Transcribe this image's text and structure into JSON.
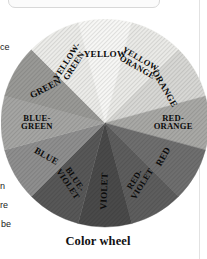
{
  "figure": {
    "caption": "Color wheel",
    "center": {
      "x": 104,
      "y": 104
    },
    "radius": 104
  },
  "margin_text_fragments": [
    {
      "id": "ce",
      "text": "ce"
    },
    {
      "id": "n",
      "text": "n"
    },
    {
      "id": "re",
      "text": "re"
    },
    {
      "id": "be",
      "text": "be"
    }
  ],
  "chart_data": {
    "type": "pie",
    "title": "Color wheel",
    "legend_position": "none",
    "grid": false,
    "note": "Twelve equal 30-degree segments of a color wheel, reproduced in grayscale halftone. Segment 1 (YELLOW) is centered at the top (12 o'clock) and segments proceed clockwise.",
    "categories": [
      "YELLOW",
      "YELLOW-ORANGE",
      "ORANGE",
      "RED-ORANGE",
      "RED",
      "RED-VIOLET",
      "VIOLET",
      "BLUE-VIOLET",
      "BLUE",
      "BLUE-GREEN",
      "GREEN",
      "YELLOW-GREEN"
    ],
    "values": [
      30,
      30,
      30,
      30,
      30,
      30,
      30,
      30,
      30,
      30,
      30,
      30
    ],
    "units": "degrees",
    "slice_colors": [
      "#f8f8f6",
      "#ebebe8",
      "#d8d8d5",
      "#a9a9a6",
      "#6f6f6f",
      "#5e5e5e",
      "#4a4a4a",
      "#585858",
      "#8f8f8f",
      "#a6a6a4",
      "#9a9a97",
      "#ededea"
    ],
    "segments": [
      {
        "label": "YELLOW",
        "lines": [
          "YELLOW"
        ],
        "start_deg": -15,
        "end_deg": 15,
        "color": "#f8f8f6",
        "label_rotation_deg": 0,
        "two_line": false
      },
      {
        "label": "YELLOW-ORANGE",
        "lines": [
          "YELLOW-",
          "ORANGE"
        ],
        "start_deg": 15,
        "end_deg": 45,
        "color": "#ebebe8",
        "label_rotation_deg": 30,
        "two_line": true
      },
      {
        "label": "ORANGE",
        "lines": [
          "ORANGE"
        ],
        "start_deg": 45,
        "end_deg": 75,
        "color": "#d8d8d5",
        "label_rotation_deg": 60,
        "two_line": false
      },
      {
        "label": "RED-ORANGE",
        "lines": [
          "RED-",
          "ORANGE"
        ],
        "start_deg": 75,
        "end_deg": 105,
        "color": "#a9a9a6",
        "label_rotation_deg": 0,
        "two_line": true
      },
      {
        "label": "RED",
        "lines": [
          "RED"
        ],
        "start_deg": 105,
        "end_deg": 135,
        "color": "#6f6f6f",
        "label_rotation_deg": -60,
        "two_line": false
      },
      {
        "label": "RED-VIOLET",
        "lines": [
          "RED-",
          "VIOLET"
        ],
        "start_deg": 135,
        "end_deg": 165,
        "color": "#5e5e5e",
        "label_rotation_deg": -58,
        "two_line": true
      },
      {
        "label": "VIOLET",
        "lines": [
          "VIOLET"
        ],
        "start_deg": 165,
        "end_deg": 195,
        "color": "#4a4a4a",
        "label_rotation_deg": -88,
        "two_line": false
      },
      {
        "label": "BLUE-VIOLET",
        "lines": [
          "BLUE-",
          "VIOLET"
        ],
        "start_deg": 195,
        "end_deg": 225,
        "color": "#585858",
        "label_rotation_deg": 56,
        "two_line": true
      },
      {
        "label": "BLUE",
        "lines": [
          "BLUE"
        ],
        "start_deg": 225,
        "end_deg": 255,
        "color": "#8f8f8f",
        "label_rotation_deg": 30,
        "two_line": false
      },
      {
        "label": "BLUE-GREEN",
        "lines": [
          "BLUE-",
          "GREEN"
        ],
        "start_deg": 255,
        "end_deg": 285,
        "color": "#a6a6a4",
        "label_rotation_deg": 0,
        "two_line": true
      },
      {
        "label": "GREEN",
        "lines": [
          "GREEN"
        ],
        "start_deg": 285,
        "end_deg": 315,
        "color": "#9a9a97",
        "label_rotation_deg": -28,
        "two_line": false
      },
      {
        "label": "YELLOW-GREEN",
        "lines": [
          "YELLOW-",
          "GREEN"
        ],
        "start_deg": 315,
        "end_deg": 345,
        "color": "#ededea",
        "label_rotation_deg": -57,
        "two_line": true
      }
    ]
  }
}
